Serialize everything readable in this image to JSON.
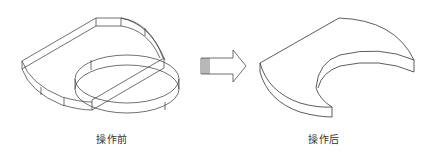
{
  "figure": {
    "before": {
      "caption": "操作前",
      "shapes": [
        "D-shaped extruded solid",
        "cylinder overlapping solid"
      ]
    },
    "arrow": {
      "icon": "right-arrow-icon",
      "direction": "right"
    },
    "after": {
      "caption": "操作后",
      "shapes": [
        "D-shaped solid with cylindrical cut-out (crescent)"
      ]
    },
    "colors": {
      "line": "#333333",
      "background": "#ffffff"
    }
  }
}
